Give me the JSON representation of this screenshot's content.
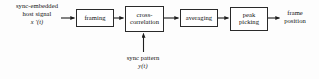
{
  "diagram": {
    "type": "block-diagram",
    "background_color": "#fdfdfd",
    "stroke_color": "#2a2a2a",
    "text_color": "#111111",
    "blocks": [
      {
        "id": "framing",
        "label_line1": "framing",
        "label_line2": ""
      },
      {
        "id": "crosscorr",
        "label_line1": "cross-",
        "label_line2": "correlation"
      },
      {
        "id": "averaging",
        "label_line1": "averaging",
        "label_line2": ""
      },
      {
        "id": "peakpicking",
        "label_line1": "peak",
        "label_line2": "picking"
      }
    ],
    "labels": {
      "input": {
        "line1": "sync-embedded",
        "line2": "host signal",
        "math": "x '(t)"
      },
      "sync_pattern": {
        "line1": "sync pattern",
        "math": "y(t)"
      },
      "output": {
        "line1": "frame",
        "line2": "position"
      }
    },
    "connections": [
      {
        "from": "input",
        "to": "framing",
        "direction": "right"
      },
      {
        "from": "framing",
        "to": "crosscorr",
        "direction": "right"
      },
      {
        "from": "syncpattern",
        "to": "crosscorr",
        "direction": "up"
      },
      {
        "from": "crosscorr",
        "to": "averaging",
        "direction": "right"
      },
      {
        "from": "averaging",
        "to": "peakpicking",
        "direction": "right"
      },
      {
        "from": "peakpicking",
        "to": "output",
        "direction": "right"
      }
    ]
  }
}
